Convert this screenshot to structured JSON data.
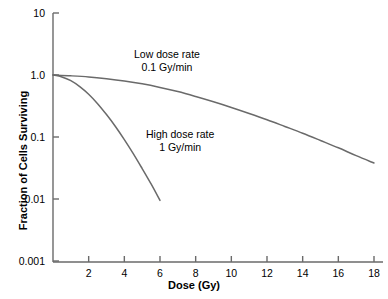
{
  "chart_data": {
    "type": "line",
    "title": "",
    "xlabel": "Dose (Gy)",
    "ylabel": "Fraction of Cells Surviving",
    "xlim": [
      0,
      18.5
    ],
    "ylim": [
      0.001,
      10
    ],
    "yscale": "log",
    "xscale": "linear",
    "grid": false,
    "legend": "none",
    "xticks": [
      2,
      4,
      6,
      8,
      10,
      12,
      14,
      16,
      18
    ],
    "xtick_labels": [
      "2",
      "4",
      "6",
      "8",
      "10",
      "12",
      "14",
      "16",
      "18"
    ],
    "yticks": [
      10,
      1.0,
      0.1,
      0.01,
      0.001
    ],
    "ytick_labels": [
      "10",
      "1.0",
      "0.1",
      "0.01",
      "0.001"
    ],
    "line_color": "#6a6a6a",
    "axis_color": "#6a6a6a",
    "series": [
      {
        "name": "Low dose rate 0.1 Gy/min",
        "annotation_line1": "Low dose rate",
        "annotation_line2": "0.1 Gy/min",
        "x": [
          0,
          1,
          2,
          3,
          4,
          5,
          6,
          7,
          8,
          9,
          10,
          11,
          12,
          13,
          14,
          15,
          16,
          17,
          18
        ],
        "y": [
          1.0,
          0.97,
          0.93,
          0.87,
          0.8,
          0.72,
          0.63,
          0.54,
          0.45,
          0.37,
          0.3,
          0.24,
          0.19,
          0.148,
          0.115,
          0.088,
          0.067,
          0.05,
          0.038
        ]
      },
      {
        "name": "High dose rate 1 Gy/min",
        "annotation_line1": "High dose rate",
        "annotation_line2": "1 Gy/min",
        "x": [
          0,
          0.5,
          1,
          1.5,
          2,
          2.5,
          3,
          3.5,
          4,
          4.5,
          5,
          5.5,
          6
        ],
        "y": [
          1.0,
          0.93,
          0.81,
          0.65,
          0.49,
          0.345,
          0.23,
          0.148,
          0.091,
          0.054,
          0.031,
          0.0175,
          0.0095
        ]
      }
    ]
  }
}
